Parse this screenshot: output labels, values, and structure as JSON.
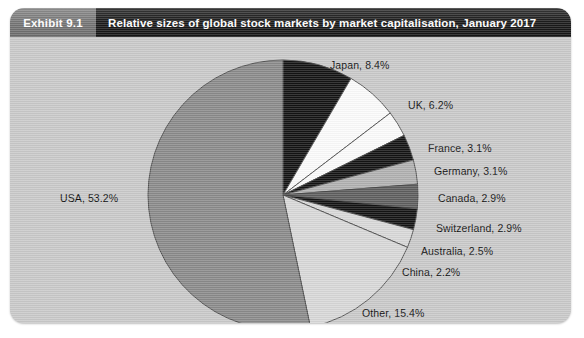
{
  "exhibit": {
    "number_label": "Exhibit 9.1",
    "title": "Relative sizes of global stock markets by market capitalisation, January 2017"
  },
  "colors": {
    "panel_background": "#c9c9c9",
    "header_number_background": "#747474",
    "header_title_background": "#1d1d1d",
    "header_text": "#ffffff",
    "label_text": "#111111",
    "slice_usa": "#8a8a8a",
    "slice_japan": "#141414",
    "slice_uk": "#fbfbfb",
    "slice_france": "#fbfbfb",
    "slice_germany": "#141414",
    "slice_canada": "#b0b0b0",
    "slice_switzerland": "#5e5e5e",
    "slice_australia": "#141414",
    "slice_china": "#d8d8d8",
    "slice_other": "#d8d8d8",
    "slice_outline": "#4a4a4a"
  },
  "chart_data": {
    "type": "pie",
    "title": "Relative sizes of global stock markets by market capitalisation, January 2017",
    "unit": "%",
    "start_angle_deg": 0,
    "direction": "clockwise",
    "legend": "none",
    "labels_position": "outside-with-leader",
    "categories": [
      "Japan",
      "UK",
      "France",
      "Germany",
      "Canada",
      "Switzerland",
      "Australia",
      "China",
      "Other",
      "USA"
    ],
    "values": [
      8.4,
      6.2,
      3.1,
      3.1,
      2.9,
      2.9,
      2.5,
      2.2,
      15.4,
      53.2
    ],
    "slices": [
      {
        "name": "Japan",
        "value": 8.4,
        "label": "Japan, 8.4%",
        "color": "#141414",
        "label_x": 320,
        "label_y": 22
      },
      {
        "name": "UK",
        "value": 6.2,
        "label": "UK, 6.2%",
        "color": "#fbfbfb",
        "label_x": 398,
        "label_y": 62
      },
      {
        "name": "France",
        "value": 3.1,
        "label": "France, 3.1%",
        "color": "#fbfbfb",
        "label_x": 418,
        "label_y": 105
      },
      {
        "name": "Germany",
        "value": 3.1,
        "label": "Germany, 3.1%",
        "color": "#141414",
        "label_x": 424,
        "label_y": 128
      },
      {
        "name": "Canada",
        "value": 2.9,
        "label": "Canada, 2.9%",
        "color": "#b0b0b0",
        "label_x": 428,
        "label_y": 155
      },
      {
        "name": "Switzerland",
        "value": 2.9,
        "label": "Switzerland, 2.9%",
        "color": "#5e5e5e",
        "label_x": 426,
        "label_y": 185
      },
      {
        "name": "Australia",
        "value": 2.5,
        "label": "Australia, 2.5%",
        "color": "#141414",
        "label_x": 411,
        "label_y": 208
      },
      {
        "name": "China",
        "value": 2.2,
        "label": "China, 2.2%",
        "color": "#d8d8d8",
        "label_x": 392,
        "label_y": 229
      },
      {
        "name": "Other",
        "value": 15.4,
        "label": "Other, 15.4%",
        "color": "#d8d8d8",
        "label_x": 352,
        "label_y": 270
      },
      {
        "name": "USA",
        "value": 53.2,
        "label": "USA, 53.2%",
        "color": "#8a8a8a",
        "label_x": 50,
        "label_y": 155
      }
    ],
    "geometry": {
      "center_x": 273,
      "center_y": 158,
      "radius": 135
    }
  }
}
